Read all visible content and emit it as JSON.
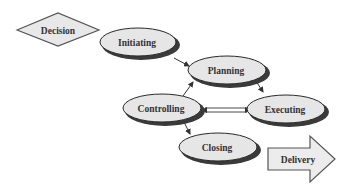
{
  "diagram": {
    "type": "process-flow",
    "colors": {
      "node_fill": "#e6e6e6",
      "node_stroke": "#2a2a2a",
      "shadow": "#3a3a3a",
      "edge": "#333333",
      "text": "#333333",
      "background": "#ffffff"
    },
    "nodes": [
      {
        "id": "decision",
        "label": "Decision",
        "shape": "diamond"
      },
      {
        "id": "initiating",
        "label": "Initiating",
        "shape": "ellipse"
      },
      {
        "id": "planning",
        "label": "Planning",
        "shape": "ellipse"
      },
      {
        "id": "controlling",
        "label": "Controlling",
        "shape": "ellipse"
      },
      {
        "id": "executing",
        "label": "Executing",
        "shape": "ellipse"
      },
      {
        "id": "closing",
        "label": "Closing",
        "shape": "ellipse"
      },
      {
        "id": "delivery",
        "label": "Delivery",
        "shape": "block-arrow"
      }
    ],
    "edges": [
      {
        "from": "initiating",
        "to": "planning",
        "style": "single-arrow"
      },
      {
        "from": "planning",
        "to": "executing",
        "style": "single-arrow"
      },
      {
        "from": "controlling",
        "to": "planning",
        "style": "single-arrow"
      },
      {
        "from": "controlling",
        "to": "executing",
        "style": "double-line-bidirectional"
      },
      {
        "from": "controlling",
        "to": "closing",
        "style": "single-arrow"
      }
    ]
  }
}
